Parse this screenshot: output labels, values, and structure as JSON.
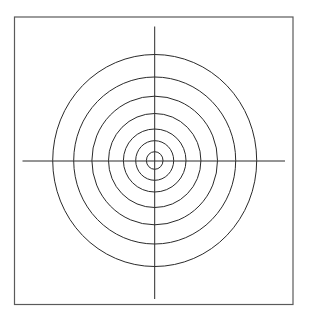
{
  "diagram": {
    "type": "concentric-circles-target",
    "colors": {
      "background": "#ffffff",
      "frame": "#5a5a5a",
      "lines": "#2a2a2a"
    },
    "frame": {
      "x": 14.5,
      "y": 17,
      "width": 278.5,
      "height": 287.5
    },
    "center": {
      "x": 154.7,
      "y": 160.5
    },
    "crosshair": {
      "horizontal": {
        "x1": 22.5,
        "x2": 285,
        "y": 161
      },
      "vertical": {
        "x": 154.7,
        "y1": 26.5,
        "y2": 299
      }
    },
    "rings": [
      {
        "index": 1,
        "rx": 8.3,
        "ry": 8.8
      },
      {
        "index": 2,
        "rx": 19,
        "ry": 19.8
      },
      {
        "index": 3,
        "rx": 31.3,
        "ry": 31.5
      },
      {
        "index": 4,
        "rx": 46.2,
        "ry": 47
      },
      {
        "index": 5,
        "rx": 62.8,
        "ry": 64.3
      },
      {
        "index": 6,
        "rx": 81,
        "ry": 83.5
      },
      {
        "index": 7,
        "rx": 102,
        "ry": 106
      }
    ]
  }
}
